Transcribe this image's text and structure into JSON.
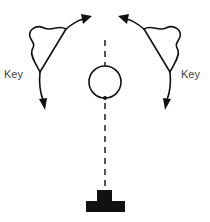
{
  "diagram": {
    "labels": {
      "left_key": "Key",
      "right_key": "Key"
    },
    "colors": {
      "stroke": "#111111",
      "label": "#444444",
      "background": "#ffffff"
    },
    "elements": [
      {
        "id": "left-key-shape",
        "type": "curved-lobe-with-arrows",
        "label": "Key"
      },
      {
        "id": "right-key-shape",
        "type": "curved-lobe-with-arrows",
        "label": "Key"
      },
      {
        "id": "center-circle",
        "type": "circle"
      },
      {
        "id": "upper-dashed-line",
        "type": "dashed-line"
      },
      {
        "id": "lower-dashed-line",
        "type": "dashed-line"
      },
      {
        "id": "base-block",
        "type": "stepped-block"
      }
    ]
  }
}
